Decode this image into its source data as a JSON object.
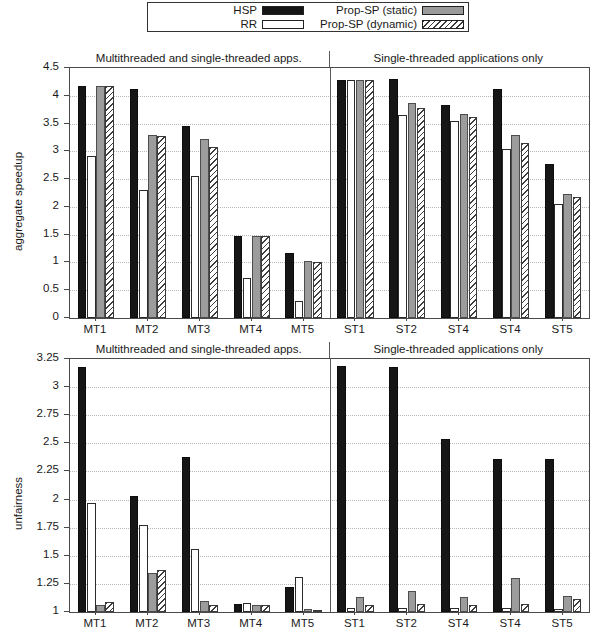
{
  "legend": {
    "entries": [
      {
        "label": "HSP",
        "swatch": "solid-black-swatch"
      },
      {
        "label": "Prop-SP (static)",
        "swatch": "solid-gray-swatch"
      },
      {
        "label": "RR",
        "swatch": "empty-white-swatch"
      },
      {
        "label": "Prop-SP (dynamic)",
        "swatch": "hatched-swatch"
      }
    ]
  },
  "sections": {
    "left_caption": "Multithreaded and single-threaded apps.",
    "right_caption": "Single-threaded applications only"
  },
  "chart_data": [
    {
      "id": "aggregate-speedup",
      "type": "bar",
      "title": "",
      "xlabel": "",
      "ylabel": "aggregate speedup",
      "ylim": [
        0,
        4.5
      ],
      "yticks": [
        "0",
        "0.5",
        "1",
        "1.5",
        "2",
        "2.5",
        "3",
        "3.5",
        "4",
        "4.5"
      ],
      "ytick_values": [
        0,
        0.5,
        1,
        1.5,
        2,
        2.5,
        3,
        3.5,
        4,
        4.5
      ],
      "grid": true,
      "legend_position": "above-figure",
      "categories": [
        "MT1",
        "MT2",
        "MT3",
        "MT4",
        "MT5",
        "ST1",
        "ST2",
        "ST4",
        "ST4",
        "ST5"
      ],
      "section_split_after_index": 4,
      "series": [
        {
          "name": "HSP",
          "values": [
            4.18,
            4.12,
            3.45,
            1.47,
            1.17,
            4.28,
            4.3,
            3.83,
            4.12,
            2.78
          ]
        },
        {
          "name": "RR",
          "values": [
            2.92,
            2.3,
            2.55,
            0.72,
            0.3,
            4.28,
            3.65,
            3.55,
            3.05,
            2.05
          ]
        },
        {
          "name": "Prop-SP (static)",
          "values": [
            4.18,
            3.3,
            3.22,
            1.47,
            1.02,
            4.28,
            3.87,
            3.68,
            3.3,
            2.23
          ]
        },
        {
          "name": "Prop-SP (dynamic)",
          "values": [
            4.18,
            3.27,
            3.07,
            1.48,
            1.0,
            4.28,
            3.78,
            3.62,
            3.15,
            2.18
          ]
        }
      ]
    },
    {
      "id": "unfairness",
      "type": "bar",
      "title": "",
      "xlabel": "",
      "ylabel": "unfairness",
      "ylim": [
        1,
        3.25
      ],
      "yticks": [
        "1",
        "1.25",
        "1.5",
        "1.75",
        "2",
        "2.25",
        "2.5",
        "2.75",
        "3",
        "3.25"
      ],
      "ytick_values": [
        1,
        1.25,
        1.5,
        1.75,
        2,
        2.25,
        2.5,
        2.75,
        3,
        3.25
      ],
      "grid": true,
      "legend_position": "above-figure",
      "categories": [
        "MT1",
        "MT2",
        "MT3",
        "MT4",
        "MT5",
        "ST1",
        "ST2",
        "ST4",
        "ST4",
        "ST5"
      ],
      "section_split_after_index": 4,
      "series": [
        {
          "name": "HSP",
          "values": [
            3.18,
            2.03,
            2.38,
            1.07,
            1.22,
            3.19,
            3.18,
            2.54,
            2.36,
            2.36
          ]
        },
        {
          "name": "RR",
          "values": [
            1.97,
            1.77,
            1.56,
            1.08,
            1.31,
            1.04,
            1.04,
            1.04,
            1.04,
            1.03
          ]
        },
        {
          "name": "Prop-SP (static)",
          "values": [
            1.06,
            1.35,
            1.1,
            1.06,
            1.03,
            1.13,
            1.19,
            1.13,
            1.3,
            1.14
          ]
        },
        {
          "name": "Prop-SP (dynamic)",
          "values": [
            1.09,
            1.37,
            1.06,
            1.06,
            1.02,
            1.06,
            1.07,
            1.06,
            1.07,
            1.12
          ]
        }
      ]
    }
  ]
}
